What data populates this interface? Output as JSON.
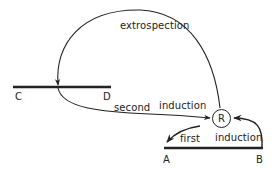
{
  "diagram": {
    "nodes": {
      "R": "R",
      "A": "A",
      "B": "B",
      "C": "C",
      "D": "D"
    },
    "edges": {
      "extrospection": "extrospection",
      "second": "second",
      "second_induction": "induction",
      "first": "first",
      "first_induction": "induction"
    },
    "colors": {
      "stroke": "#222222",
      "background": "#ffffff"
    }
  }
}
